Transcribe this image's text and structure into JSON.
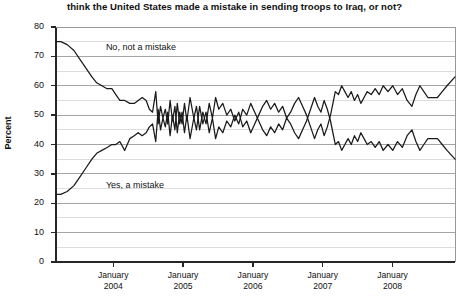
{
  "chart_data": {
    "type": "line",
    "title": "think the United States made a mistake in sending troops to Iraq, or not?",
    "xlabel": "",
    "ylabel": "Percent",
    "ylim": [
      0,
      80
    ],
    "ytick_step": 10,
    "minor_gridlines": true,
    "grid": true,
    "legend_position": "inline-annotations",
    "ytick_labels": [
      "80",
      "70",
      "60",
      "50",
      "40",
      "30",
      "20",
      "10",
      "0"
    ],
    "xtick_labels": [
      {
        "month": "January",
        "year": "2004"
      },
      {
        "month": "January",
        "year": "2005"
      },
      {
        "month": "January",
        "year": "2006"
      },
      {
        "month": "January",
        "year": "2007"
      },
      {
        "month": "January",
        "year": "2008"
      }
    ],
    "xlim": [
      "2003-03",
      "2008-11"
    ],
    "annotations": [
      {
        "text": "No, not a mistake",
        "x_pos": 0.115,
        "y_value": 73
      },
      {
        "text": "Yes, a mistake",
        "x_pos": 0.115,
        "y_value": 26
      }
    ],
    "series": [
      {
        "name": "No, not a mistake",
        "color": "#1a1a1a",
        "points": [
          [
            0.0,
            75
          ],
          [
            0.012,
            75
          ],
          [
            0.028,
            74
          ],
          [
            0.045,
            72
          ],
          [
            0.06,
            69
          ],
          [
            0.075,
            66
          ],
          [
            0.09,
            63
          ],
          [
            0.102,
            61
          ],
          [
            0.115,
            60
          ],
          [
            0.128,
            59
          ],
          [
            0.14,
            59
          ],
          [
            0.15,
            57
          ],
          [
            0.16,
            55
          ],
          [
            0.172,
            55
          ],
          [
            0.185,
            54
          ],
          [
            0.196,
            54
          ],
          [
            0.206,
            55
          ],
          [
            0.216,
            56
          ],
          [
            0.226,
            55
          ],
          [
            0.234,
            52
          ],
          [
            0.242,
            51
          ],
          [
            0.25,
            58
          ],
          [
            0.256,
            47
          ],
          [
            0.262,
            53
          ],
          [
            0.268,
            49
          ],
          [
            0.274,
            52
          ],
          [
            0.28,
            47
          ],
          [
            0.286,
            55
          ],
          [
            0.292,
            48
          ],
          [
            0.298,
            53
          ],
          [
            0.304,
            44
          ],
          [
            0.31,
            51
          ],
          [
            0.316,
            47
          ],
          [
            0.322,
            54
          ],
          [
            0.328,
            48
          ],
          [
            0.336,
            56
          ],
          [
            0.344,
            50
          ],
          [
            0.352,
            45
          ],
          [
            0.36,
            53
          ],
          [
            0.368,
            47
          ],
          [
            0.376,
            51
          ],
          [
            0.384,
            44
          ],
          [
            0.392,
            49
          ],
          [
            0.4,
            42
          ],
          [
            0.408,
            46
          ],
          [
            0.418,
            44
          ],
          [
            0.428,
            48
          ],
          [
            0.438,
            46
          ],
          [
            0.448,
            50
          ],
          [
            0.458,
            47
          ],
          [
            0.468,
            52
          ],
          [
            0.478,
            50
          ],
          [
            0.488,
            54
          ],
          [
            0.498,
            51
          ],
          [
            0.508,
            48
          ],
          [
            0.518,
            45
          ],
          [
            0.528,
            43
          ],
          [
            0.538,
            46
          ],
          [
            0.548,
            44
          ],
          [
            0.558,
            47
          ],
          [
            0.568,
            45
          ],
          [
            0.578,
            49
          ],
          [
            0.588,
            47
          ],
          [
            0.598,
            44
          ],
          [
            0.608,
            42
          ],
          [
            0.618,
            45
          ],
          [
            0.628,
            48
          ],
          [
            0.638,
            52
          ],
          [
            0.648,
            56
          ],
          [
            0.656,
            53
          ],
          [
            0.664,
            51
          ],
          [
            0.672,
            55
          ],
          [
            0.68,
            52
          ],
          [
            0.688,
            48
          ],
          [
            0.694,
            44
          ],
          [
            0.7,
            40
          ],
          [
            0.708,
            41
          ],
          [
            0.716,
            38
          ],
          [
            0.724,
            40
          ],
          [
            0.732,
            42
          ],
          [
            0.74,
            40
          ],
          [
            0.748,
            43
          ],
          [
            0.756,
            41
          ],
          [
            0.764,
            44
          ],
          [
            0.772,
            42
          ],
          [
            0.78,
            40
          ],
          [
            0.79,
            41
          ],
          [
            0.8,
            39
          ],
          [
            0.81,
            41
          ],
          [
            0.82,
            38
          ],
          [
            0.832,
            40
          ],
          [
            0.844,
            38
          ],
          [
            0.856,
            41
          ],
          [
            0.868,
            39
          ],
          [
            0.88,
            43
          ],
          [
            0.892,
            45
          ],
          [
            0.902,
            41
          ],
          [
            0.912,
            38
          ],
          [
            0.922,
            40
          ],
          [
            0.932,
            42
          ],
          [
            0.944,
            42
          ],
          [
            0.956,
            42
          ],
          [
            0.968,
            40
          ],
          [
            0.98,
            38
          ],
          [
            1.0,
            35
          ]
        ]
      },
      {
        "name": "Yes, a mistake",
        "color": "#1a1a1a",
        "points": [
          [
            0.0,
            23
          ],
          [
            0.012,
            23
          ],
          [
            0.028,
            24
          ],
          [
            0.045,
            26
          ],
          [
            0.06,
            29
          ],
          [
            0.075,
            32
          ],
          [
            0.09,
            35
          ],
          [
            0.102,
            37
          ],
          [
            0.115,
            38
          ],
          [
            0.128,
            39
          ],
          [
            0.14,
            40
          ],
          [
            0.15,
            40
          ],
          [
            0.16,
            41
          ],
          [
            0.172,
            38
          ],
          [
            0.185,
            42
          ],
          [
            0.196,
            43
          ],
          [
            0.206,
            44
          ],
          [
            0.216,
            43
          ],
          [
            0.226,
            44
          ],
          [
            0.234,
            46
          ],
          [
            0.242,
            47
          ],
          [
            0.25,
            41
          ],
          [
            0.256,
            52
          ],
          [
            0.262,
            45
          ],
          [
            0.268,
            49
          ],
          [
            0.274,
            46
          ],
          [
            0.28,
            51
          ],
          [
            0.286,
            43
          ],
          [
            0.292,
            50
          ],
          [
            0.298,
            45
          ],
          [
            0.304,
            54
          ],
          [
            0.31,
            47
          ],
          [
            0.316,
            51
          ],
          [
            0.322,
            44
          ],
          [
            0.328,
            50
          ],
          [
            0.336,
            42
          ],
          [
            0.344,
            48
          ],
          [
            0.352,
            53
          ],
          [
            0.36,
            45
          ],
          [
            0.368,
            51
          ],
          [
            0.376,
            47
          ],
          [
            0.384,
            54
          ],
          [
            0.392,
            49
          ],
          [
            0.4,
            56
          ],
          [
            0.408,
            52
          ],
          [
            0.418,
            54
          ],
          [
            0.428,
            50
          ],
          [
            0.438,
            52
          ],
          [
            0.448,
            48
          ],
          [
            0.458,
            51
          ],
          [
            0.468,
            46
          ],
          [
            0.478,
            48
          ],
          [
            0.488,
            44
          ],
          [
            0.498,
            47
          ],
          [
            0.508,
            50
          ],
          [
            0.518,
            53
          ],
          [
            0.528,
            55
          ],
          [
            0.538,
            52
          ],
          [
            0.548,
            54
          ],
          [
            0.558,
            51
          ],
          [
            0.568,
            53
          ],
          [
            0.578,
            49
          ],
          [
            0.588,
            51
          ],
          [
            0.598,
            54
          ],
          [
            0.608,
            56
          ],
          [
            0.618,
            53
          ],
          [
            0.628,
            50
          ],
          [
            0.638,
            46
          ],
          [
            0.648,
            42
          ],
          [
            0.656,
            45
          ],
          [
            0.664,
            47
          ],
          [
            0.672,
            43
          ],
          [
            0.68,
            46
          ],
          [
            0.688,
            50
          ],
          [
            0.694,
            54
          ],
          [
            0.7,
            58
          ],
          [
            0.708,
            57
          ],
          [
            0.716,
            60
          ],
          [
            0.724,
            58
          ],
          [
            0.732,
            56
          ],
          [
            0.74,
            58
          ],
          [
            0.748,
            55
          ],
          [
            0.756,
            57
          ],
          [
            0.764,
            54
          ],
          [
            0.772,
            56
          ],
          [
            0.78,
            58
          ],
          [
            0.79,
            57
          ],
          [
            0.8,
            59
          ],
          [
            0.81,
            57
          ],
          [
            0.82,
            60
          ],
          [
            0.832,
            58
          ],
          [
            0.844,
            60
          ],
          [
            0.856,
            57
          ],
          [
            0.868,
            59
          ],
          [
            0.88,
            55
          ],
          [
            0.892,
            53
          ],
          [
            0.902,
            57
          ],
          [
            0.912,
            60
          ],
          [
            0.922,
            58
          ],
          [
            0.932,
            56
          ],
          [
            0.944,
            56
          ],
          [
            0.956,
            56
          ],
          [
            0.968,
            58
          ],
          [
            0.98,
            60
          ],
          [
            1.0,
            63
          ]
        ]
      }
    ]
  }
}
